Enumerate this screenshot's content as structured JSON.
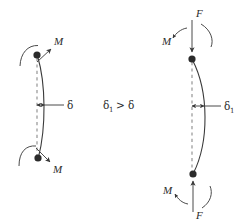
{
  "figure": {
    "background_color": "#ffffff",
    "line_color": "#3a3a3a",
    "dash_color": "#8a8a8a",
    "node_color": "#2b2b2b"
  },
  "left_case": {
    "name": "moment-only-column",
    "moment_top_label": "M",
    "moment_bottom_label": "M",
    "deflection_label": "δ",
    "deflection_value_relative": "smaller"
  },
  "center": {
    "relation_lhs": "δ",
    "relation_lhs_sub": "1",
    "relation_operator": ">",
    "relation_rhs": "δ",
    "relation_text": "δ₁ > δ"
  },
  "right_case": {
    "name": "moment-plus-axial-load-column",
    "force_top_label": "F",
    "force_bottom_label": "F",
    "moment_top_label": "M",
    "moment_bottom_label": "M",
    "deflection_label": "δ",
    "deflection_sub": "1",
    "deflection_value_relative": "larger"
  },
  "icons": {
    "node_top": "hinge-node-dot",
    "node_bottom": "hinge-node-dot",
    "curved_moment": "curved-moment-arrow",
    "straight_force": "straight-force-arrow",
    "dimension": "double-headed-dimension-arrow"
  }
}
